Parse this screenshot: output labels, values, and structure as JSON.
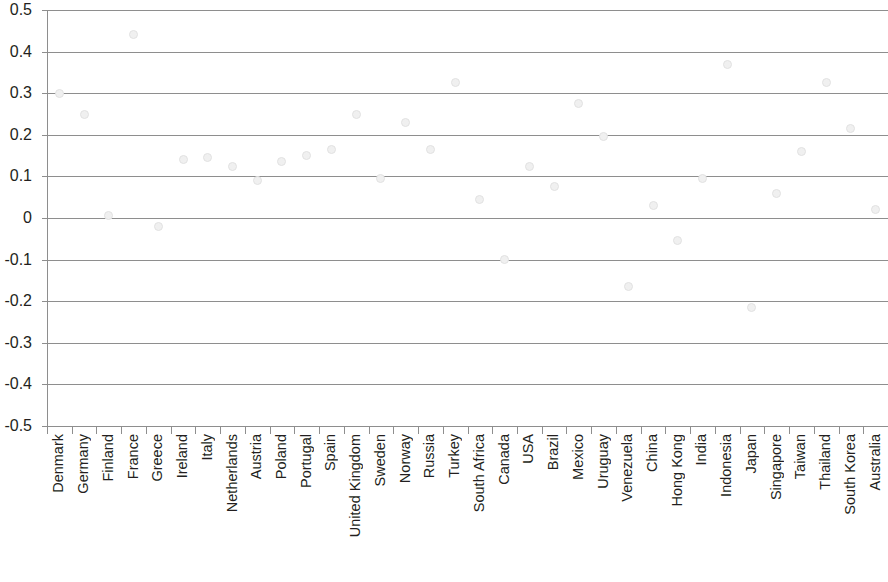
{
  "chart_data": {
    "type": "scatter",
    "title": "",
    "subtitle": "",
    "xlabel": "",
    "ylabel": "",
    "ylim": [
      -0.5,
      0.5
    ],
    "y_ticks": [
      "0.5",
      "0.4",
      "0.3",
      "0.2",
      "0.1",
      "0",
      "-0.1",
      "-0.2",
      "-0.3",
      "-0.4",
      "-0.5"
    ],
    "y_tick_values": [
      0.5,
      0.4,
      0.3,
      0.2,
      0.1,
      0,
      -0.1,
      -0.2,
      -0.3,
      -0.4,
      -0.5
    ],
    "grid": true,
    "grid_axis": "y",
    "legend": false,
    "legend_position": "none",
    "marker_color": "#f0f0f0",
    "grid_color": "#8e8e8e",
    "text_color": "#231f20",
    "categories": [
      "Denmark",
      "Germany",
      "Finland",
      "France",
      "Greece",
      "Ireland",
      "Italy",
      "Netherlands",
      "Austria",
      "Poland",
      "Portugal",
      "Spain",
      "United Kingdom",
      "Sweden",
      "Norway",
      "Russia",
      "Turkey",
      "South Africa",
      "Canada",
      "USA",
      "Brazil",
      "Mexico",
      "Uruguay",
      "Venezuela",
      "China",
      "Hong Kong",
      "India",
      "Indonesia",
      "Japan",
      "Singapore",
      "Taiwan",
      "Thailand",
      "South Korea",
      "Australia"
    ],
    "values": [
      0.3,
      0.25,
      0.005,
      0.44,
      -0.02,
      0.14,
      0.145,
      0.125,
      0.09,
      0.135,
      0.15,
      0.165,
      0.25,
      0.095,
      0.23,
      0.165,
      0.325,
      0.045,
      -0.1,
      0.125,
      0.075,
      0.275,
      0.195,
      -0.165,
      0.03,
      -0.055,
      0.095,
      0.37,
      -0.215,
      0.06,
      0.16,
      0.325,
      0.215,
      0.02
    ]
  }
}
